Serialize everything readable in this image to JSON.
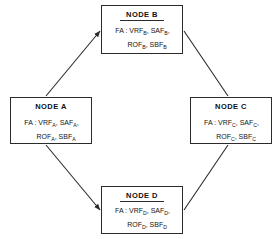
{
  "diagram": {
    "type": "ring-network-topology",
    "nodes": [
      {
        "id": "a",
        "title": "NODE A",
        "line1_prefix": "FA : VRF",
        "line1_sub1": "A",
        "line1_mid": ", SAF",
        "line1_sub2": "A",
        "line1_suffix": ",",
        "line2_prefix": "ROF",
        "line2_sub1": "A",
        "line2_mid": ", SBF",
        "line2_sub2": "A",
        "line2_suffix": ""
      },
      {
        "id": "b",
        "title": "NODE B",
        "line1_prefix": "FA : VRF",
        "line1_sub1": "B",
        "line1_mid": ", SAF",
        "line1_sub2": "B",
        "line1_suffix": ",",
        "line2_prefix": "ROF",
        "line2_sub1": "B",
        "line2_mid": ", SBF",
        "line2_sub2": "B",
        "line2_suffix": ""
      },
      {
        "id": "c",
        "title": "NODE C",
        "line1_prefix": "FA : VRF",
        "line1_sub1": "C",
        "line1_mid": ", SAF",
        "line1_sub2": "C",
        "line1_suffix": ",",
        "line2_prefix": "ROF",
        "line2_sub1": "C",
        "line2_mid": ", SBF",
        "line2_sub2": "C",
        "line2_suffix": ""
      },
      {
        "id": "d",
        "title": "NODE D",
        "line1_prefix": "FA : VRF",
        "line1_sub1": "D",
        "line1_mid": ", SAF",
        "line1_sub2": "D",
        "line1_suffix": ",",
        "line2_prefix": "ROF",
        "line2_sub1": "D",
        "line2_mid": ", SBF",
        "line2_sub2": "D",
        "line2_suffix": ""
      }
    ],
    "edges": [
      {
        "id": "a-to-b",
        "from": "a",
        "to": "b",
        "arrow": true
      },
      {
        "id": "b-to-c",
        "from": "b",
        "to": "c",
        "arrow": false
      },
      {
        "id": "c-to-d",
        "from": "c",
        "to": "d",
        "arrow": false
      },
      {
        "id": "a-to-d",
        "from": "a",
        "to": "d",
        "arrow": true
      }
    ],
    "colors": {
      "line": "#2b2b2b",
      "text": "#141414",
      "background": "#ffffff"
    }
  }
}
